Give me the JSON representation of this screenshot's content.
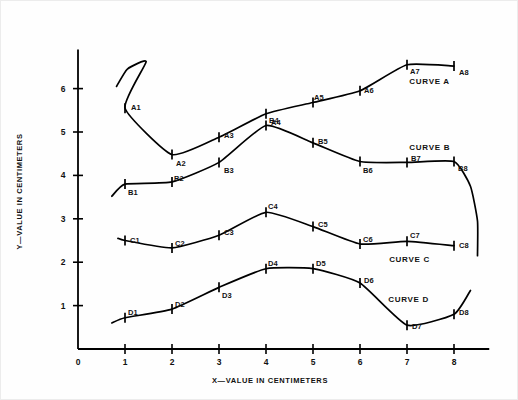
{
  "chart_data": {
    "type": "line",
    "title": "",
    "xlabel": "X—VALUE IN CENTIMETERS",
    "ylabel": "Y—VALUE IN CENTIMETERS",
    "xlim": [
      0,
      8.75
    ],
    "ylim": [
      0,
      6.9
    ],
    "xticks": [
      "0",
      "1",
      "2",
      "3",
      "4",
      "5",
      "6",
      "7",
      "8"
    ],
    "xtick_values": [
      0,
      1,
      2,
      3,
      4,
      5,
      6,
      7,
      8
    ],
    "yticks": [
      "0",
      "1",
      "2",
      "3",
      "4",
      "5",
      "6"
    ],
    "ytick_values": [
      0,
      1,
      2,
      3,
      4,
      5,
      6
    ],
    "grid": false,
    "legend": "inline-curve-labels",
    "marker_style": "tick-cross",
    "line_color": "#000000",
    "axis_color": "#000000",
    "background": "#ffffff",
    "series": [
      {
        "name": "CURVE A",
        "label": "CURVE A",
        "label_x": 7.05,
        "label_y": 6.15,
        "x": [
          1,
          2,
          3,
          4,
          5,
          6,
          7,
          8
        ],
        "values": [
          5.55,
          4.48,
          4.88,
          5.42,
          5.68,
          5.95,
          6.55,
          6.52
        ],
        "point_labels": [
          "A1",
          "A2",
          "A3",
          "A4",
          "A5",
          "A6",
          "A7",
          "A8"
        ],
        "lead_in": "hook-up-right",
        "lead_in_points": [
          [
            0.82,
            6.05
          ],
          [
            1.05,
            6.45
          ],
          [
            1.45,
            6.62
          ]
        ],
        "tail": "none"
      },
      {
        "name": "CURVE B",
        "label": "CURVE B",
        "label_x": 7.05,
        "label_y": 4.62,
        "x": [
          1,
          2,
          3,
          4,
          5,
          6,
          7,
          8
        ],
        "values": [
          3.8,
          3.85,
          4.3,
          5.15,
          4.75,
          4.32,
          4.3,
          4.32
        ],
        "point_labels": [
          "B1",
          "B2",
          "B3",
          "B4",
          "B5",
          "B6",
          "B7",
          "B8"
        ],
        "lead_in": "rise-from-left",
        "lead_in_points": [
          [
            0.72,
            3.52
          ]
        ],
        "tail": "steep-drop",
        "tail_points": [
          [
            8.35,
            3.75
          ],
          [
            8.5,
            2.95
          ],
          [
            8.5,
            2.15
          ]
        ]
      },
      {
        "name": "CURVE C",
        "label": "CURVE C",
        "label_x": 6.62,
        "label_y": 2.05,
        "x": [
          1,
          2,
          3,
          4,
          5,
          6,
          7,
          8
        ],
        "values": [
          2.5,
          2.33,
          2.62,
          3.15,
          2.82,
          2.42,
          2.48,
          2.38
        ],
        "point_labels": [
          "C1",
          "C2",
          "C3",
          "C4",
          "C5",
          "C6",
          "C7",
          "C8"
        ],
        "lead_in": "short-stub",
        "lead_in_points": [
          [
            0.85,
            2.55
          ]
        ],
        "tail": "none"
      },
      {
        "name": "CURVE D",
        "label": "CURVE D",
        "label_x": 6.6,
        "label_y": 1.12,
        "x": [
          1,
          2,
          3,
          4,
          5,
          6,
          7,
          8
        ],
        "values": [
          0.72,
          0.92,
          1.42,
          1.85,
          1.85,
          1.52,
          0.55,
          0.8
        ],
        "point_labels": [
          "D1",
          "D2",
          "D3",
          "D4",
          "D5",
          "D6",
          "D7",
          "D8"
        ],
        "lead_in": "short-stub",
        "lead_in_points": [
          [
            0.72,
            0.6
          ]
        ],
        "tail": "rise-up",
        "tail_points": [
          [
            8.35,
            1.35
          ]
        ]
      }
    ],
    "point_label_offsets": {
      "A1": [
        6,
        -1
      ],
      "A2": [
        4,
        8
      ],
      "A3": [
        5,
        -2
      ],
      "A4": [
        5,
        8
      ],
      "A5": [
        1,
        -5
      ],
      "A6": [
        4,
        -1
      ],
      "A7": [
        3,
        6
      ],
      "A8": [
        5,
        6
      ],
      "B1": [
        3,
        8
      ],
      "B2": [
        2,
        -4
      ],
      "B3": [
        5,
        8
      ],
      "B4": [
        3,
        -5
      ],
      "B5": [
        5,
        -2
      ],
      "B6": [
        3,
        8
      ],
      "B7": [
        4,
        -4
      ],
      "B8": [
        4,
        6
      ],
      "C1": [
        5,
        -1
      ],
      "C2": [
        3,
        -5
      ],
      "C3": [
        5,
        -3
      ],
      "C4": [
        2,
        -6
      ],
      "C5": [
        5,
        -3
      ],
      "C6": [
        3,
        -5
      ],
      "C7": [
        3,
        -6
      ],
      "C8": [
        5,
        -1
      ],
      "D1": [
        3,
        -6
      ],
      "D2": [
        3,
        -5
      ],
      "D3": [
        3,
        8
      ],
      "D4": [
        2,
        -6
      ],
      "D5": [
        3,
        -6
      ],
      "D6": [
        4,
        -3
      ],
      "D7": [
        5,
        1
      ],
      "D8": [
        5,
        -2
      ]
    }
  }
}
